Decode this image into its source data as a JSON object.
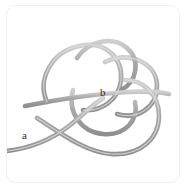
{
  "figure": {
    "background_color": "#ffffff",
    "card_border_color": "#f0f0f0",
    "rope_color": "#a9a9a9",
    "rope_highlight_color": "#cfcfcf",
    "rope_shadow_color": "#8f8f8f",
    "rope_thickness_px": 4.6,
    "label_color": "#2b2b2b",
    "labels": [
      {
        "id": "a",
        "text": "a",
        "meaning": "free-rope-end",
        "x": 21,
        "y": 131
      },
      {
        "id": "b",
        "text": "b",
        "meaning": "knot-crossing-center",
        "x": 101,
        "y": 90
      }
    ],
    "strands": [
      {
        "name": "tail-strand-a",
        "note": "free end exits left edge at label a, rises right-ward",
        "path": "M -10 146 C 22 144, 44 134, 62 120 C 76 109, 84 100, 96 92"
      },
      {
        "name": "lower-big-loop",
        "note": "large loop sweeping down-right then up the right side",
        "path": "M 30 112 C 52 126, 78 146, 104 148 C 134 150, 152 132, 152 110 C 152 88, 136 74, 118 74"
      },
      {
        "name": "left-upper-loop",
        "note": "loop at upper-left of the knot",
        "path": "M 40 96 C 30 74, 44 46, 72 40 C 98 34, 116 52, 114 74 C 112 94, 94 106, 76 104"
      },
      {
        "name": "top-small-loop",
        "note": "small loop crossing over the top-center",
        "path": "M 70 52 C 82 34, 106 30, 120 42 C 134 54, 130 76, 114 84"
      },
      {
        "name": "right-upper-loop",
        "note": "loop on the upper-right of the knot",
        "path": "M 98 56 C 124 44, 150 58, 150 80 C 150 102, 130 114, 110 108"
      },
      {
        "name": "center-cross-strand",
        "note": "nearly horizontal strand passing through the knot centre near label b",
        "path": "M 18 100 C 48 94, 86 88, 120 86 C 140 85, 154 86, 162 88"
      },
      {
        "name": "inner-loop",
        "note": "inner loop descending below the centre crossing",
        "path": "M 66 84 C 60 106, 74 126, 96 128 C 118 130, 132 114, 128 96"
      }
    ]
  }
}
